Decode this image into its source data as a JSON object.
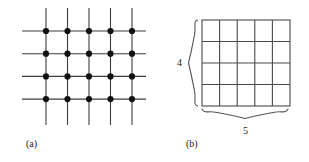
{
  "figure": {
    "title": "",
    "background_color": "#ffffff",
    "line_color": "#3d3d3d",
    "dot_color": "#111111",
    "grid_color": "#4a4a4a",
    "brace_color": "#555555",
    "panels": [
      {
        "id": "panel-a",
        "caption": "(a)",
        "kind": "lattice-points",
        "description": "square lattice of dots at intersections of 5 vertical and 4 horizontal lines",
        "vertical_lines": 5,
        "horizontal_lines": 4,
        "dot_count": 20,
        "dot_radius": 3.1,
        "geometry": {
          "first_col_x": 46,
          "col_spacing": 21.5,
          "first_row_y": 31,
          "row_spacing": 22.7,
          "line_overhang": 23,
          "h_line_start_x": 22,
          "h_line_end_x": 146,
          "v_line_start_y": 8,
          "v_line_end_y": 125
        },
        "columns_x": [
          46,
          67.5,
          89,
          110.5,
          132
        ],
        "rows_y": [
          31,
          53.7,
          76.4,
          99.1
        ]
      },
      {
        "id": "panel-b",
        "caption": "(b)",
        "kind": "cell-grid-with-braces",
        "description": "rectangle divided into a 5 by 4 array of unit cells, with braces marking 4 rows and 5 columns",
        "columns": 5,
        "rows": 4,
        "cell_count": 20,
        "geometry": {
          "left": 202,
          "top": 20,
          "right": 290,
          "bottom": 106,
          "width": 88,
          "height": 86,
          "cell_width": 17.6,
          "cell_height": 21.5
        },
        "braces": [
          {
            "id": "row-brace",
            "orientation": "vertical",
            "side": "left",
            "label": "4",
            "spans": "rows",
            "label_x": 177,
            "label_y": 58,
            "brace_x": 196,
            "brace_top": 20,
            "brace_bottom": 106
          },
          {
            "id": "column-brace",
            "orientation": "horizontal",
            "side": "bottom",
            "label": "5",
            "spans": "columns",
            "label_x": 243,
            "label_y": 126,
            "brace_y": 112,
            "brace_left": 202,
            "brace_right": 290
          }
        ]
      }
    ]
  }
}
